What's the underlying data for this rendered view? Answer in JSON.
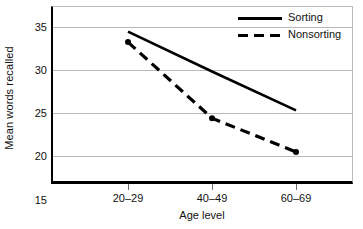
{
  "chart_data": {
    "type": "line",
    "title": "",
    "xlabel": "Age level",
    "ylabel": "Mean words recalled",
    "categories": [
      "20–29",
      "40–49",
      "60–69"
    ],
    "ylim": [
      15,
      35
    ],
    "yticks": [
      35,
      30,
      25,
      20,
      15
    ],
    "ytick_labels": [
      "35",
      "30",
      "25",
      "20",
      "15"
    ],
    "grid": "horizontal",
    "legend_position": "top-right-inside",
    "series": [
      {
        "name": "Sorting",
        "style": "solid",
        "markers": "none",
        "color": "#000000",
        "values": [
          34.4,
          29.8,
          25.3
        ]
      },
      {
        "name": "Nonsorting",
        "style": "dashed",
        "markers": "filled-circle",
        "color": "#000000",
        "values": [
          33.2,
          24.4,
          20.5
        ]
      }
    ]
  },
  "axes": {
    "y_label": "Mean words recalled",
    "x_label": "Age level",
    "y_tick_labels": [
      "35",
      "30",
      "25",
      "20",
      "15"
    ],
    "x_tick_labels": [
      "20–29",
      "40–49",
      "60–69"
    ]
  },
  "legend": {
    "items": [
      {
        "label": "Sorting",
        "style": "solid"
      },
      {
        "label": "Nonsorting",
        "style": "dashed"
      }
    ]
  },
  "colors": {
    "ink": "#000000",
    "grid": "#b9b9b9",
    "background": "#ffffff"
  }
}
